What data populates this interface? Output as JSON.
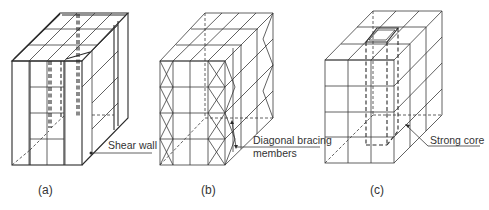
{
  "figure": {
    "panels": [
      {
        "id": "a",
        "caption": "(a)",
        "annotation": "Shear wall",
        "system": "shear-wall"
      },
      {
        "id": "b",
        "caption": "(b)",
        "annotation_line1": "Diagonal bracing",
        "annotation_line2": "members",
        "system": "braced-frame"
      },
      {
        "id": "c",
        "caption": "(c)",
        "annotation": "Strong core",
        "system": "core"
      }
    ],
    "colors": {
      "line": "#3a3a3a",
      "text": "#333333",
      "background": "#ffffff"
    }
  }
}
